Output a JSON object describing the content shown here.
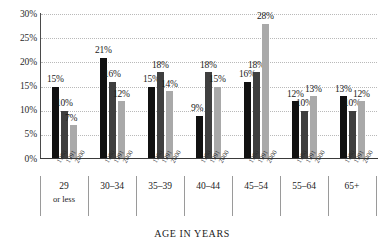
{
  "chart_data": {
    "type": "bar",
    "title": "",
    "xlabel": "AGE IN YEARS",
    "ylabel": "",
    "ylim": [
      0,
      30
    ],
    "yticks": [
      "0%",
      "5%",
      "10%",
      "15%",
      "20%",
      "25%",
      "30%"
    ],
    "ytick_values": [
      0,
      5,
      10,
      15,
      20,
      25,
      30
    ],
    "grid": true,
    "legend_position": "none",
    "categories": [
      "29 or less",
      "30–34",
      "35–39",
      "40–44",
      "45–54",
      "55–64",
      "65+"
    ],
    "category_lines": [
      [
        "29",
        "or less"
      ],
      [
        "30–34",
        ""
      ],
      [
        "35–39",
        ""
      ],
      [
        "40–44",
        ""
      ],
      [
        "45–54",
        ""
      ],
      [
        "55–64",
        ""
      ],
      [
        "65+",
        ""
      ]
    ],
    "subgroup_labels": [
      "1980",
      "1991",
      "2000"
    ],
    "series": [
      {
        "name": "1980",
        "color": "#111111",
        "values": [
          15,
          21,
          15,
          9,
          16,
          12,
          13
        ],
        "data_labels": [
          "15%",
          "21%",
          "15%",
          "9%",
          "16%",
          "12%",
          "13%"
        ]
      },
      {
        "name": "1991",
        "color": "#3f3f3f",
        "values": [
          10,
          16,
          18,
          18,
          18,
          10,
          10
        ],
        "data_labels": [
          "10%",
          "16%",
          "18%",
          "18%",
          "18%",
          "10%",
          "10%"
        ]
      },
      {
        "name": "2000",
        "color": "#a9a9a9",
        "values": [
          7,
          12,
          14,
          15,
          28,
          13,
          12
        ],
        "data_labels": [
          "7%",
          "12%",
          "14%",
          "15%",
          "28%",
          "13%",
          "12%"
        ]
      }
    ]
  },
  "colors": {
    "bar_1980": "#111111",
    "bar_1991": "#3f3f3f",
    "bar_2000": "#a9a9a9",
    "gridline": "#b9b9b9",
    "axis": "#3a3a3a",
    "text": "#1b1b1b",
    "background": "#ffffff"
  }
}
